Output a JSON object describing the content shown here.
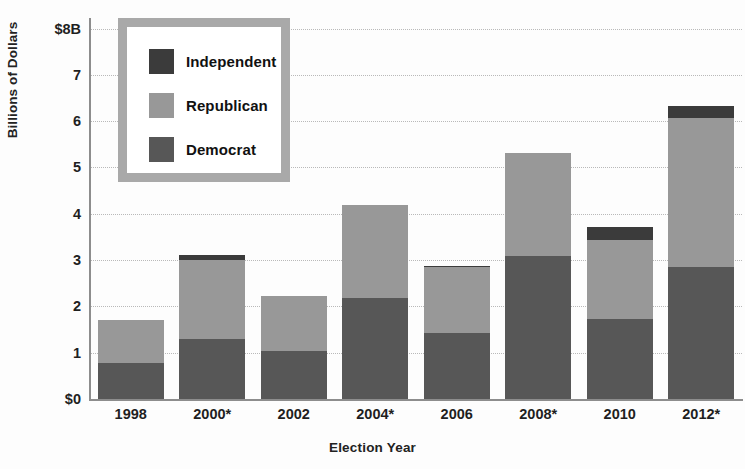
{
  "chart_data": {
    "type": "bar",
    "subtype": "stacked-bar",
    "title": "",
    "xlabel": "Election Year",
    "ylabel": "Billions of Dollars",
    "categories": [
      "1998",
      "2000*",
      "2002",
      "2004*",
      "2006",
      "2008*",
      "2010",
      "2012*"
    ],
    "series": [
      {
        "name": "Democrat",
        "color": "#575757",
        "values": [
          0.78,
          1.29,
          1.03,
          2.19,
          1.42,
          3.08,
          1.72,
          2.84
        ]
      },
      {
        "name": "Republican",
        "color": "#989898",
        "values": [
          0.92,
          1.71,
          1.19,
          2.0,
          1.42,
          2.23,
          1.72,
          3.22
        ]
      },
      {
        "name": "Independent",
        "color": "#3b3b3b",
        "values": [
          0.0,
          0.1,
          0.0,
          0.0,
          0.04,
          0.0,
          0.28,
          0.26
        ]
      }
    ],
    "totals": [
      1.7,
      3.1,
      2.22,
      4.19,
      2.88,
      5.31,
      3.72,
      6.32
    ],
    "stack_order": [
      "Democrat",
      "Republican",
      "Independent"
    ],
    "ylim": [
      0,
      8
    ],
    "ytick_values": [
      0,
      1,
      2,
      3,
      4,
      5,
      6,
      7,
      8
    ],
    "ytick_labels": [
      "$0",
      "1",
      "2",
      "3",
      "4",
      "5",
      "6",
      "7",
      "$8B"
    ],
    "grid": true,
    "grid_axis": "y",
    "grid_style": "dotted",
    "grid_color": "#b9b9b9",
    "legend_position": "top-left",
    "legend_entries": [
      "Independent",
      "Republican",
      "Democrat"
    ],
    "annotations": []
  },
  "axes": {
    "y_title": "Billions of Dollars",
    "x_title": "Election Year"
  },
  "legend": {
    "items": [
      {
        "label": "Independent",
        "color": "#3b3b3b"
      },
      {
        "label": "Republican",
        "color": "#989898"
      },
      {
        "label": "Democrat",
        "color": "#575757"
      }
    ]
  }
}
